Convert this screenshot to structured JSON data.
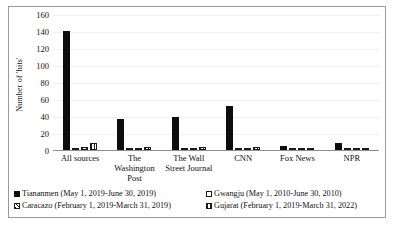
{
  "chart_data": {
    "type": "bar",
    "title": "",
    "xlabel": "",
    "ylabel": "Number of 'hits'",
    "ylim": [
      0,
      160
    ],
    "yticks": [
      0,
      20,
      40,
      60,
      80,
      100,
      120,
      140,
      160
    ],
    "grid": true,
    "legend_position": "bottom",
    "categories": [
      "All sources",
      "The Washington Post",
      "The Wall Street Journal",
      "CNN",
      "Fox News",
      "NPR"
    ],
    "series": [
      {
        "name": "Tiananmen (May 1, 2019-June 30, 2019)",
        "marker": "solid-black",
        "values": [
          140,
          37,
          39,
          52,
          5,
          8
        ]
      },
      {
        "name": "Gwangju (May 1, 2010-June 30, 2010)",
        "marker": "white-outline",
        "values": [
          2,
          0,
          0,
          2,
          0,
          0
        ]
      },
      {
        "name": "Caracazo (February 1, 2019-March 31, 2019)",
        "marker": "diagonal-hatch",
        "values": [
          3,
          1,
          0,
          0,
          0,
          0
        ]
      },
      {
        "name": "Gujarat (February 1, 2019-March 31, 2022)",
        "marker": "vertical-hatch",
        "values": [
          8,
          4,
          4,
          4,
          0,
          0
        ]
      }
    ]
  },
  "axis": {
    "y_label": "Number of 'hits'",
    "tick_labels": [
      "160",
      "140",
      "120",
      "100",
      "80",
      "60",
      "40",
      "20",
      "0"
    ]
  },
  "categories": [
    "All sources",
    "The Washington Post",
    "The Wall Street Journal",
    "CNN",
    "Fox News",
    "NPR"
  ],
  "legend": {
    "items": [
      "Tiananmen (May 1, 2019-June 30, 2019)",
      "Gwangju (May 1, 2010-June 30, 2010)",
      "Caracazo (February 1, 2019-March 31, 2019)",
      "Gujarat (February 1, 2019-March 31, 2022)"
    ]
  }
}
